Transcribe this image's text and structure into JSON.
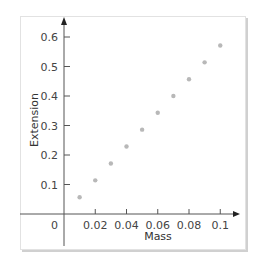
{
  "chart_data": {
    "type": "scatter",
    "title": "",
    "xlabel": "Mass",
    "ylabel": "Extension",
    "xlim": [
      0,
      0.11
    ],
    "ylim": [
      0,
      0.6
    ],
    "grid": false,
    "legend": null,
    "x_ticks": [
      "0",
      "0.02",
      "0.04",
      "0.06",
      "0.08",
      "0.1"
    ],
    "y_ticks": [
      "0.1",
      "0.2",
      "0.3",
      "0.4",
      "0.5",
      "0.6"
    ],
    "series": [
      {
        "name": "data",
        "x": [
          0.01,
          0.02,
          0.03,
          0.04,
          0.05,
          0.06,
          0.07,
          0.08,
          0.09,
          0.1
        ],
        "y": [
          0.057,
          0.114,
          0.171,
          0.229,
          0.286,
          0.343,
          0.4,
          0.457,
          0.514,
          0.571
        ]
      }
    ],
    "colors": {
      "points": "#b8b8b8",
      "axes": "#555555"
    }
  }
}
